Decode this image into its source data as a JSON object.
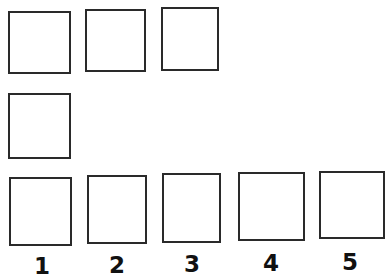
{
  "diagram": {
    "rows": [
      {
        "name": "top-row",
        "count": 3
      },
      {
        "name": "middle-row",
        "count": 1
      },
      {
        "name": "bottom-row",
        "count": 5
      }
    ],
    "labels": [
      "1",
      "2",
      "3",
      "4",
      "5"
    ],
    "colors": {
      "stroke": "#2a2a2a",
      "fill": "#ffffff",
      "label": "#111111"
    }
  }
}
